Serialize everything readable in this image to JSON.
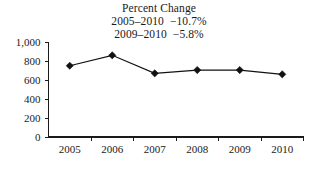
{
  "chart_data": {
    "type": "line",
    "title": "Percent Change",
    "subtitle_lines": [
      "2005–2010  −10.7%",
      "2009–2010  −5.8%"
    ],
    "xlabel": "",
    "ylabel": "",
    "categories": [
      "2005",
      "2006",
      "2007",
      "2008",
      "2009",
      "2010"
    ],
    "x": [
      2005,
      2006,
      2007,
      2008,
      2009,
      2010
    ],
    "values": [
      750,
      860,
      670,
      705,
      705,
      660
    ],
    "series": [
      {
        "name": "value",
        "values": [
          750,
          860,
          670,
          705,
          705,
          660
        ],
        "marker": "diamond",
        "color": "#111111"
      }
    ],
    "ylim": [
      0,
      1000
    ],
    "ytick_values": [
      0,
      200,
      400,
      600,
      800,
      1000
    ],
    "ytick_labels": [
      "0",
      "200",
      "400",
      "600",
      "800",
      "1,000"
    ],
    "xtick_labels": [
      "2005",
      "2006",
      "2007",
      "2008",
      "2009",
      "2010"
    ],
    "grid": false,
    "legend": null,
    "legend_position": "none",
    "annotations": [
      {
        "text": "2005–2010  −10.7%",
        "role": "subtitle-line-1"
      },
      {
        "text": "2009–2010  −5.8%",
        "role": "subtitle-line-2"
      }
    ]
  },
  "colors": {
    "background": "#ffffff",
    "axis": "#1a1a1a",
    "series": "#111111",
    "text": "#1a1a1a"
  }
}
